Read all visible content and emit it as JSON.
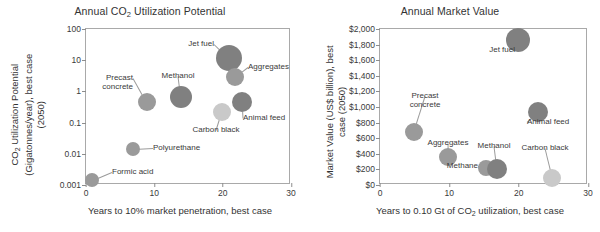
{
  "figure": {
    "width": 600,
    "height": 232,
    "marker_color_dark": "#808080",
    "marker_color_mid": "#9a9a9a",
    "marker_color_light": "#c9c9c9",
    "frame_color": "#a9a9a9"
  },
  "panels": [
    {
      "id": "left",
      "title": "Annual CO",
      "title_sub": "2",
      "title_rest": " Utilization Potential"
    },
    {
      "id": "right",
      "title": "Annual Market Value"
    }
  ],
  "chart_data": [
    {
      "type": "scatter",
      "title": "Annual CO2 Utilization Potential",
      "xlabel": "Years to 10% market penetration, best case",
      "ylabel": "CO2 Utilization Potential (Gigatonnes/year), best case (2050)",
      "ylabel_line1": "CO",
      "ylabel_line1_sub": "2",
      "ylabel_line1_rest": " Utilization Potential",
      "ylabel_line2": "(Gigatonnes/year), best case",
      "ylabel_line3": "(2050)",
      "yscale": "log",
      "xscale": "linear",
      "xlim": [
        0,
        30
      ],
      "ylim": [
        0.001,
        100
      ],
      "xticks": [
        "0",
        "10",
        "20",
        "30"
      ],
      "xtick_values": [
        0,
        10,
        20,
        30
      ],
      "yticks": [
        "0.001",
        "0.01",
        "0.1",
        "1",
        "10",
        "100"
      ],
      "ytick_values": [
        0.001,
        0.01,
        0.1,
        1,
        10,
        100
      ],
      "grid": false,
      "legend": "none",
      "points": [
        {
          "name": "Formic acid",
          "x": 1.0,
          "y": 0.0013,
          "size": 7,
          "shade": "mid",
          "label_pos": {
            "x": 112,
            "y": 172,
            "align": "left"
          }
        },
        {
          "name": "Polyurethane",
          "x": 7.0,
          "y": 0.013,
          "size": 7,
          "shade": "mid",
          "label_pos": {
            "x": 153,
            "y": 148,
            "align": "left"
          }
        },
        {
          "name": "Precast\nconcrete",
          "x": 9.0,
          "y": 0.42,
          "size": 9,
          "shade": "mid",
          "label_pos": {
            "x": 133,
            "y": 78,
            "align": "right"
          }
        },
        {
          "name": "Methanol",
          "x": 14.0,
          "y": 0.62,
          "size": 11,
          "shade": "dark",
          "label_pos": {
            "x": 178,
            "y": 76,
            "align": "center"
          }
        },
        {
          "name": "Jet fuel",
          "x": 21.0,
          "y": 11.0,
          "size": 13,
          "shade": "dark",
          "label_pos": {
            "x": 214,
            "y": 44,
            "align": "right"
          }
        },
        {
          "name": "Aggregates",
          "x": 22.0,
          "y": 2.7,
          "size": 9,
          "shade": "mid",
          "label_pos": {
            "x": 248,
            "y": 67,
            "align": "left"
          }
        },
        {
          "name": "Carbon black",
          "x": 20.0,
          "y": 0.21,
          "size": 9,
          "shade": "light",
          "label_pos": {
            "x": 216,
            "y": 130,
            "align": "center"
          }
        },
        {
          "name": "Animal feed",
          "x": 23.0,
          "y": 0.43,
          "size": 10,
          "shade": "dark",
          "label_pos": {
            "x": 243,
            "y": 118,
            "align": "left"
          }
        }
      ]
    },
    {
      "type": "scatter",
      "title": "Annual Market Value",
      "xlabel": "Years to 0.10 Gt of CO2 utilization,  best case",
      "xlabel_pre": "Years to 0.10 Gt of CO",
      "xlabel_sub": "2",
      "xlabel_post": " utilization,  best case",
      "ylabel": "Market Value (US$ billion), best case (2050)",
      "ylabel_line1": "Market Value (US$ billion), best",
      "ylabel_line2": "case (2050)",
      "yscale": "linear",
      "xscale": "linear",
      "xlim": [
        0,
        30
      ],
      "ylim": [
        0,
        2000
      ],
      "xticks": [
        "0",
        "10",
        "20",
        "30"
      ],
      "xtick_values": [
        0,
        10,
        20,
        30
      ],
      "yticks": [
        "$0",
        "$200",
        "$400",
        "$600",
        "$800",
        "$1,000",
        "$1,200",
        "$1,400",
        "$1,600",
        "$1,800",
        "$2,000"
      ],
      "ytick_values": [
        0,
        200,
        400,
        600,
        800,
        1000,
        1200,
        1400,
        1600,
        1800,
        2000
      ],
      "grid": false,
      "legend": "none",
      "points": [
        {
          "name": "Precast\nconcrete",
          "x": 5.0,
          "y": 670,
          "size": 9,
          "shade": "mid",
          "label_pos": {
            "x": 425,
            "y": 96,
            "align": "center"
          }
        },
        {
          "name": "Aggregates",
          "x": 10.0,
          "y": 340,
          "size": 9,
          "shade": "mid",
          "label_pos": {
            "x": 448,
            "y": 143,
            "align": "center"
          }
        },
        {
          "name": "Methane",
          "x": 15.5,
          "y": 200,
          "size": 8,
          "shade": "mid",
          "label_pos": {
            "x": 478,
            "y": 166,
            "align": "right"
          }
        },
        {
          "name": "Methanol",
          "x": 17.0,
          "y": 190,
          "size": 10,
          "shade": "dark",
          "label_pos": {
            "x": 494,
            "y": 146,
            "align": "center"
          }
        },
        {
          "name": "Jet fuel",
          "x": 20.0,
          "y": 1850,
          "size": 12,
          "shade": "dark",
          "label_pos": {
            "x": 515,
            "y": 50,
            "align": "right"
          }
        },
        {
          "name": "Animal feed",
          "x": 23.0,
          "y": 920,
          "size": 10,
          "shade": "dark",
          "label_pos": {
            "x": 527,
            "y": 122,
            "align": "left"
          }
        },
        {
          "name": "Carbon black",
          "x": 25.0,
          "y": 80,
          "size": 9,
          "shade": "light",
          "label_pos": {
            "x": 545,
            "y": 148,
            "align": "center"
          }
        }
      ]
    }
  ]
}
